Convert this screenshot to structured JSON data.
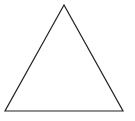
{
  "diagram": {
    "shape": "triangle",
    "kind": "equilateral",
    "fill": "#ffffff",
    "stroke": "#222222",
    "stroke_width": 1.2,
    "vertices": {
      "apex": [
        64,
        5
      ],
      "bottom_left": [
        5,
        111
      ],
      "bottom_right": [
        123,
        111
      ]
    }
  }
}
